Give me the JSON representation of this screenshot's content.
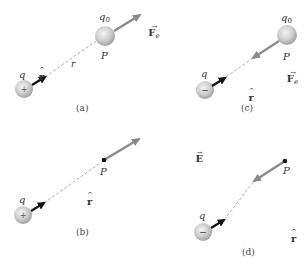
{
  "colors": {
    "sphere_fill": "#c8c8c8",
    "sphere_highlight": "#eeeeee",
    "sphere_shadow": "#9a9a9a",
    "unit_vector_arrow": "#111111",
    "field_arrow": "#8a8a8a",
    "dashed_line": "#9a9a9a",
    "text": "#333333"
  },
  "panels": [
    {
      "id": "a",
      "caption": "(a)",
      "source_charge": {
        "label": "q",
        "sign": "+",
        "center": [
          24,
          89
        ]
      },
      "unit_vector": {
        "label": "r",
        "hat": "^"
      },
      "distance_label": "r",
      "point": {
        "label": "P",
        "kind": "test-charge-sphere",
        "charge_label": "q",
        "charge_subscript": "0"
      },
      "vector": {
        "symbol": "F",
        "subscript": "e",
        "direction": "away-from-q"
      }
    },
    {
      "id": "b",
      "caption": "(b)",
      "source_charge": {
        "label": "q",
        "sign": "+",
        "center": [
          23,
          215
        ]
      },
      "unit_vector": {
        "label": "r",
        "hat": "^"
      },
      "point": {
        "label": "P",
        "kind": "point"
      },
      "vector": {
        "symbol": "E",
        "direction": "away-from-q"
      }
    },
    {
      "id": "c",
      "caption": "(c)",
      "source_charge": {
        "label": "q",
        "sign": "−",
        "center": [
          205,
          90
        ]
      },
      "unit_vector": {
        "label": "r",
        "hat": "^"
      },
      "point": {
        "label": "P",
        "kind": "test-charge-sphere",
        "charge_label": "q",
        "charge_subscript": "0"
      },
      "vector": {
        "symbol": "F",
        "subscript": "e",
        "direction": "toward-q"
      }
    },
    {
      "id": "d",
      "caption": "(d)",
      "source_charge": {
        "label": "q",
        "sign": "−",
        "center": [
          203,
          232
        ]
      },
      "unit_vector": {
        "label": "r",
        "hat": "^"
      },
      "point": {
        "label": "P",
        "kind": "point"
      },
      "vector": {
        "symbol": "E",
        "direction": "toward-q"
      }
    }
  ],
  "glyphs": {
    "vector_arrow": "→",
    "hat": "^"
  }
}
